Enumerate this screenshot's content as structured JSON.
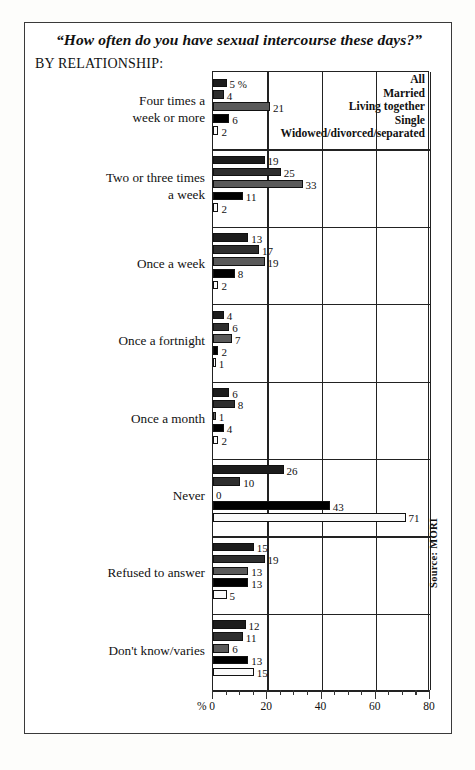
{
  "title": "“How often do you have sexual intercourse these days?”",
  "subtitle": "BY RELATIONSHIP:",
  "source": "Source: MORI",
  "percent_mark": "%",
  "chart_data": {
    "type": "bar",
    "orientation": "horizontal",
    "title": "“How often do you have sexual intercourse these days?”",
    "subtitle": "BY RELATIONSHIP:",
    "xlabel": "%",
    "ylabel": "",
    "xlim": [
      0,
      80
    ],
    "xticks": [
      0,
      20,
      40,
      60,
      80
    ],
    "xtick_labels": [
      "0",
      "20",
      "40",
      "60",
      "80"
    ],
    "minor_tick_step": 5,
    "grid": "vertical-major-only",
    "legend_position": "top-right",
    "source": "Source: MORI",
    "categories": [
      "Four times a week or more",
      "Two or three times a week",
      "Once a week",
      "Once a fortnight",
      "Once a month",
      "Never",
      "Refused to answer",
      "Don't know/varies"
    ],
    "category_lines": [
      [
        "Four times a",
        "week or more"
      ],
      [
        "Two or three times",
        "a week"
      ],
      [
        "Once a week",
        ""
      ],
      [
        "Once a fortnight",
        ""
      ],
      [
        "Once a month",
        ""
      ],
      [
        "Never",
        ""
      ],
      [
        "Refused to answer",
        ""
      ],
      [
        "Don't know/varies",
        ""
      ]
    ],
    "series": [
      {
        "name": "All",
        "color": "#1c1c1c",
        "values": [
          5,
          19,
          13,
          4,
          6,
          26,
          15,
          12
        ]
      },
      {
        "name": "Married",
        "color": "#2e2e2e",
        "values": [
          4,
          25,
          17,
          6,
          8,
          10,
          19,
          11
        ]
      },
      {
        "name": "Living together",
        "color": "#5a5a5a",
        "values": [
          21,
          33,
          19,
          7,
          1,
          0,
          13,
          6
        ]
      },
      {
        "name": "Single",
        "color": "#000000",
        "values": [
          6,
          11,
          8,
          2,
          4,
          43,
          13,
          13
        ]
      },
      {
        "name": "Widowed/divorced/separated",
        "color": "#fafafa",
        "values": [
          2,
          2,
          2,
          1,
          2,
          71,
          5,
          15
        ]
      }
    ],
    "value_labels": [
      [
        "5 %",
        "4",
        "21",
        "6",
        "2"
      ],
      [
        "19",
        "25",
        "33",
        "11",
        "2"
      ],
      [
        "13",
        "17",
        "19",
        "8",
        "2"
      ],
      [
        "4",
        "6",
        "7",
        "2",
        "1"
      ],
      [
        "6",
        "8",
        "1",
        "4",
        "2"
      ],
      [
        "26",
        "10",
        "0",
        "43",
        "71"
      ],
      [
        "15",
        "19",
        "13",
        "13",
        "5"
      ],
      [
        "12",
        "11",
        "6",
        "13",
        "15"
      ]
    ]
  }
}
